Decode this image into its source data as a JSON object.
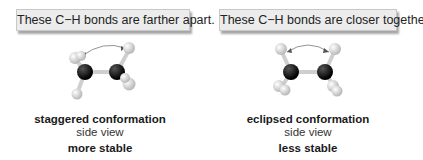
{
  "panels": [
    {
      "callout": "These C−H bonds are farther apart.",
      "conformation": "staggered conformation",
      "view": "side view",
      "stability": "more stable"
    },
    {
      "callout": "These C−H bonds are closer together.",
      "conformation": "eclipsed conformation",
      "view": "side view",
      "stability": "less stable"
    }
  ],
  "colors": {
    "carbon": "#111111",
    "hydrogen": "#e6e6e6",
    "callout_bg": "#ececec"
  }
}
